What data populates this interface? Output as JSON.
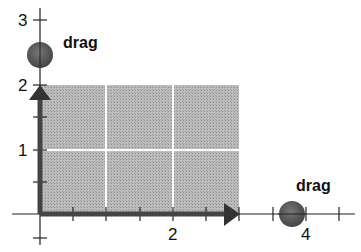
{
  "diagram": {
    "type": "vector-rectangle-area",
    "origin_px": [
      40,
      214
    ],
    "unit_px": 66.5,
    "x_axis": {
      "tick_labels": [
        "2",
        "4"
      ],
      "half_ticks": true,
      "range": [
        -0.5,
        4.7
      ]
    },
    "y_axis": {
      "tick_labels": [
        "1",
        "2",
        "3"
      ],
      "half_ticks": true,
      "range": [
        -0.5,
        3.2
      ]
    },
    "rectangle": {
      "width": 3,
      "height": 2,
      "fill": "#b4b4b4",
      "grid_color": "#ffffff"
    },
    "vectors": {
      "x_vector": {
        "length": 3,
        "color": "#444444"
      },
      "y_vector": {
        "length": 2,
        "color": "#444444"
      }
    },
    "handles": [
      {
        "id": "x-handle",
        "label": "drag",
        "value": 3.8,
        "axis": "x",
        "color": "#555555"
      },
      {
        "id": "y-handle",
        "label": "drag",
        "value": 2.4,
        "axis": "y",
        "color": "#555555"
      }
    ]
  }
}
